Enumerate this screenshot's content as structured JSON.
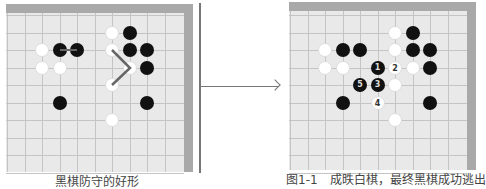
{
  "left_board": {
    "stones": [
      {
        "c": 2,
        "r": 2,
        "color": "w"
      },
      {
        "c": 3,
        "r": 2,
        "color": "b"
      },
      {
        "c": 4,
        "r": 2,
        "color": "b"
      },
      {
        "c": 2,
        "r": 3,
        "color": "w"
      },
      {
        "c": 3,
        "r": 3,
        "color": "w"
      },
      {
        "c": 6,
        "r": 1,
        "color": "w"
      },
      {
        "c": 7,
        "r": 1,
        "color": "b"
      },
      {
        "c": 6,
        "r": 2,
        "color": "w"
      },
      {
        "c": 7,
        "r": 2,
        "color": "b"
      },
      {
        "c": 8,
        "r": 2,
        "color": "b"
      },
      {
        "c": 7,
        "r": 3,
        "color": "w"
      },
      {
        "c": 8,
        "r": 3,
        "color": "b"
      },
      {
        "c": 6,
        "r": 4,
        "color": "w"
      },
      {
        "c": 3,
        "r": 5,
        "color": "b"
      },
      {
        "c": 8,
        "r": 5,
        "color": "b"
      },
      {
        "c": 6,
        "r": 6,
        "color": "w"
      }
    ],
    "caption": "黑棋防守的好形"
  },
  "right_board": {
    "stones": [
      {
        "c": 6,
        "r": 1,
        "color": "w"
      },
      {
        "c": 7,
        "r": 1,
        "color": "b"
      },
      {
        "c": 2,
        "r": 2,
        "color": "w"
      },
      {
        "c": 3,
        "r": 2,
        "color": "b"
      },
      {
        "c": 4,
        "r": 2,
        "color": "b"
      },
      {
        "c": 6,
        "r": 2,
        "color": "w"
      },
      {
        "c": 7,
        "r": 2,
        "color": "b"
      },
      {
        "c": 8,
        "r": 2,
        "color": "b"
      },
      {
        "c": 2,
        "r": 3,
        "color": "w"
      },
      {
        "c": 3,
        "r": 3,
        "color": "w"
      },
      {
        "c": 5,
        "r": 3,
        "color": "b",
        "label": "1"
      },
      {
        "c": 6,
        "r": 3,
        "color": "w",
        "label": "2"
      },
      {
        "c": 7,
        "r": 3,
        "color": "w"
      },
      {
        "c": 8,
        "r": 3,
        "color": "b"
      },
      {
        "c": 4,
        "r": 4,
        "color": "b",
        "label": "5"
      },
      {
        "c": 5,
        "r": 4,
        "color": "b",
        "label": "3"
      },
      {
        "c": 6,
        "r": 4,
        "color": "w"
      },
      {
        "c": 3,
        "r": 5,
        "color": "b"
      },
      {
        "c": 5,
        "r": 5,
        "color": "w",
        "label": "4"
      },
      {
        "c": 8,
        "r": 5,
        "color": "b"
      },
      {
        "c": 6,
        "r": 6,
        "color": "w"
      }
    ],
    "caption": "图1-1　成昳白棋，最终黑棋成功逃出"
  }
}
